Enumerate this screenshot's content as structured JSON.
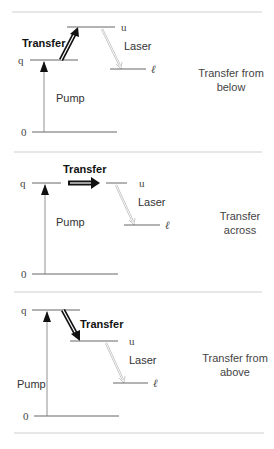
{
  "panels": [
    {
      "id": "below",
      "level_labels": {
        "ground": "0",
        "pump_level": "q",
        "upper": "u",
        "lower": "ℓ"
      },
      "pump_label": "Pump",
      "transfer_label": "Transfer",
      "laser_label": "Laser",
      "caption_line1": "Transfer from",
      "caption_line2": "below"
    },
    {
      "id": "across",
      "level_labels": {
        "ground": "0",
        "pump_level": "q",
        "upper": "u",
        "lower": "ℓ"
      },
      "pump_label": "Pump",
      "transfer_label": "Transfer",
      "laser_label": "Laser",
      "caption_line1": "Transfer",
      "caption_line2": "across"
    },
    {
      "id": "above",
      "level_labels": {
        "ground": "0",
        "pump_level": "q",
        "upper": "u",
        "lower": "ℓ"
      },
      "pump_label": "Pump",
      "transfer_label": "Transfer",
      "laser_label": "Laser",
      "caption_line1": "Transfer from",
      "caption_line2": "above"
    }
  ],
  "colors": {
    "line": "#555555",
    "divider": "#cfcfcf",
    "arrow": "#111111"
  }
}
